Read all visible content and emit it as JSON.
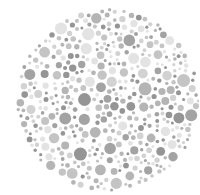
{
  "plate": {
    "type": "ishihara-style dot plate",
    "background": "#ffffff",
    "circle": {
      "cx": 108,
      "cy": 100,
      "r": 92
    },
    "dot_colors": [
      "#e3e3e3",
      "#d2d2d2",
      "#c4c4c4",
      "#b5b5b5",
      "#a3a3a3",
      "#959595"
    ],
    "dot_radius_range": [
      1.5,
      6.5
    ],
    "seed": 1337
  }
}
